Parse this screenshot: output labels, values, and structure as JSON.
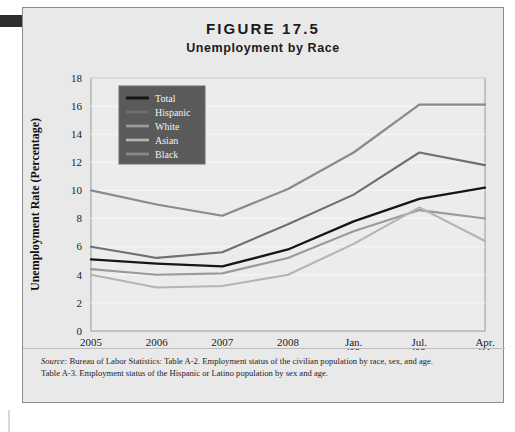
{
  "figure": {
    "number": "FIGURE 17.5",
    "subtitle": "Unemployment by Race"
  },
  "source": {
    "lead": "Source:",
    "line1": " Bureau of Labor Statistics: Table A-2. Employment status of the civilian population by race, sex, and age.",
    "line2": "Table A-3. Employment status of the Hispanic or Latino population by sex and age."
  },
  "chart_data": {
    "type": "line",
    "title": "Unemployment by Race",
    "xlabel": "Year",
    "ylabel": "Unemployment Rate (Percentage)",
    "categories": [
      "2005",
      "2006",
      "2007",
      "2008",
      "Jan. '09",
      "Jul. '09",
      "Apr. '11"
    ],
    "tick_labels_multiline": [
      {
        "line1": "2005",
        "line2": ""
      },
      {
        "line1": "2006",
        "line2": ""
      },
      {
        "line1": "2007",
        "line2": ""
      },
      {
        "line1": "2008",
        "line2": ""
      },
      {
        "line1": "Jan.",
        "line2": "'09"
      },
      {
        "line1": "Jul.",
        "line2": "'09"
      },
      {
        "line1": "Apr.",
        "line2": "'11"
      }
    ],
    "ylim": [
      0,
      18
    ],
    "yticks": [
      0,
      2,
      4,
      6,
      8,
      10,
      12,
      14,
      16,
      18
    ],
    "grid": true,
    "legend_position": "top-left-inside",
    "series": [
      {
        "name": "Total",
        "color": "#161616",
        "width": 2.3,
        "values": [
          5.1,
          4.8,
          4.6,
          5.8,
          7.8,
          9.4,
          10.2
        ]
      },
      {
        "name": "Hispanic",
        "color": "#6f6f6f",
        "width": 2.1,
        "values": [
          6.0,
          5.2,
          5.6,
          7.6,
          9.7,
          12.7,
          11.8
        ]
      },
      {
        "name": "White",
        "color": "#9a9a9a",
        "width": 2.1,
        "values": [
          4.4,
          4.0,
          4.1,
          5.2,
          7.1,
          8.6,
          8.0
        ]
      },
      {
        "name": "Asian",
        "color": "#b4b4b4",
        "width": 2.1,
        "values": [
          4.0,
          3.1,
          3.2,
          4.0,
          6.2,
          8.8,
          6.4
        ]
      },
      {
        "name": "Black",
        "color": "#8a8a8a",
        "width": 2.2,
        "values": [
          10.0,
          9.0,
          8.2,
          10.1,
          12.7,
          16.1,
          16.1
        ]
      }
    ]
  }
}
